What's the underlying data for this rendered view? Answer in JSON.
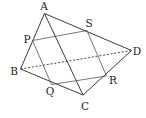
{
  "diagram": {
    "type": "tetrahedron-cross-section",
    "colors": {
      "line": "#3a3a3a",
      "section": "#555555",
      "text": "#222222",
      "background": "#ffffff"
    },
    "points": {
      "A": {
        "label": "A",
        "x": 44.5,
        "y": 13.5,
        "lx": 44,
        "ly": 10
      },
      "B": {
        "label": "B",
        "x": 20.5,
        "y": 69,
        "lx": 14,
        "ly": 75
      },
      "C": {
        "label": "C",
        "x": 83,
        "y": 95,
        "lx": 85,
        "ly": 110
      },
      "D": {
        "label": "D",
        "x": 131.5,
        "y": 50.5,
        "lx": 137,
        "ly": 55
      },
      "P": {
        "label": "P",
        "x": 32.5,
        "y": 40.5,
        "lx": 27,
        "ly": 43
      },
      "Q": {
        "label": "Q",
        "x": 51.5,
        "y": 84.5,
        "lx": 50,
        "ly": 95
      },
      "R": {
        "label": "R",
        "x": 106.5,
        "y": 76,
        "lx": 113,
        "ly": 84
      },
      "S": {
        "label": "S",
        "x": 87,
        "y": 30.5,
        "lx": 89,
        "ly": 27
      }
    },
    "solid_edges": [
      "AB",
      "AC",
      "AD",
      "BC",
      "CD"
    ],
    "hidden_edges": [
      "BD"
    ],
    "section_edges": [
      "PQ",
      "QR",
      "RS",
      "SP"
    ]
  }
}
